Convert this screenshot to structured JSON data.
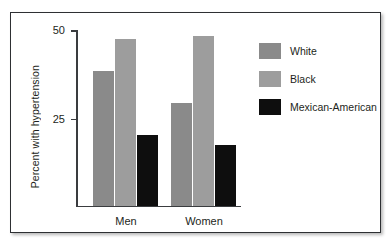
{
  "chart_data": {
    "type": "bar",
    "title": "",
    "xlabel": "",
    "ylabel": "Percent with hypertension",
    "categories": [
      "Men",
      "Women"
    ],
    "ylim": [
      0,
      50
    ],
    "yticks": [
      25,
      50
    ],
    "ytick_labels": [
      "25",
      "50"
    ],
    "grid": false,
    "legend_position": "right",
    "series": [
      {
        "name": "White",
        "color": "#8a8a8a",
        "values": [
          38,
          29
        ]
      },
      {
        "name": "Black",
        "color": "#9d9d9d",
        "values": [
          47,
          48
        ]
      },
      {
        "name": "Mexican-American",
        "color": "#0e0e0e",
        "values": [
          20,
          17
        ]
      }
    ]
  },
  "axis": {
    "ylabel": "Percent with hypertension",
    "tick_50": "50",
    "tick_25": "25"
  },
  "groups": [
    {
      "label": "Men"
    },
    {
      "label": "Women"
    }
  ],
  "legend": {
    "items": [
      {
        "label": "White",
        "color": "#8a8a8a"
      },
      {
        "label": "Black",
        "color": "#9d9d9d"
      },
      {
        "label": "Mexican-American",
        "color": "#0e0e0e"
      }
    ]
  }
}
